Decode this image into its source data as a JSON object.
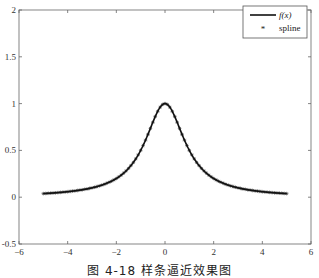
{
  "chart_data": {
    "type": "line",
    "title": "",
    "xlabel": "",
    "ylabel": "",
    "xlim": [
      -6,
      6
    ],
    "ylim": [
      -0.5,
      2
    ],
    "x_ticks": [
      -6,
      -4,
      -2,
      0,
      2,
      4,
      6
    ],
    "y_ticks": [
      -0.5,
      0,
      0.5,
      1,
      1.5,
      2
    ],
    "x_tick_labels": [
      "-6",
      "-4",
      "-2",
      "0",
      "2",
      "4",
      "6"
    ],
    "y_tick_labels": [
      "-0.5",
      "0",
      "0.5",
      "1",
      "1.5",
      "2"
    ],
    "grid": false,
    "legend_position": "upper right",
    "series": [
      {
        "name": "f(x)",
        "style": "solid line",
        "color": "#000000",
        "function": "1/(1+x^2)",
        "x_range": [
          -5,
          5
        ],
        "x": [
          -5,
          -4,
          -3,
          -2,
          -1,
          0,
          1,
          2,
          3,
          4,
          5
        ],
        "values": [
          0.038,
          0.059,
          0.1,
          0.2,
          0.5,
          1.0,
          0.5,
          0.2,
          0.1,
          0.059,
          0.038
        ]
      },
      {
        "name": "spline",
        "style": "asterisk markers",
        "color": "#000000",
        "x_range": [
          -5,
          5
        ],
        "x": [
          -5,
          -4,
          -3,
          -2,
          -1,
          0,
          1,
          2,
          3,
          4,
          5
        ],
        "values": [
          0.038,
          0.059,
          0.1,
          0.2,
          0.5,
          1.0,
          0.5,
          0.2,
          0.1,
          0.059,
          0.038
        ]
      }
    ]
  },
  "legend": {
    "items": [
      {
        "label": "f(x)",
        "symbol": "line"
      },
      {
        "label": "spline",
        "symbol": "asterisk"
      }
    ]
  },
  "caption": "图 4-18   样条逼近效果图"
}
